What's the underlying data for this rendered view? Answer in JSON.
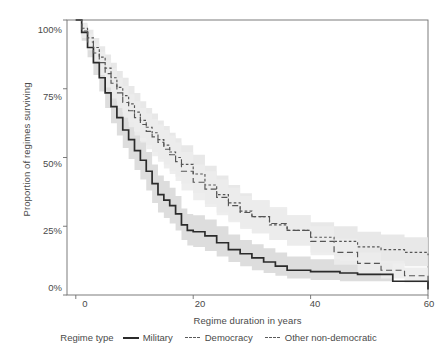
{
  "chart_data": {
    "type": "line",
    "title": "",
    "subtitle": "",
    "xlabel": "Regime duration in years",
    "ylabel": "Proportion of regimes surviving",
    "xlim": [
      -1.5,
      60
    ],
    "ylim": [
      0,
      1
    ],
    "xticks": [
      0,
      20,
      40,
      60
    ],
    "xticklabels": [
      "0",
      "20",
      "40",
      "60"
    ],
    "yticks": [
      0,
      0.25,
      0.5,
      0.75,
      1
    ],
    "yticklabels": [
      "0%",
      "25%",
      "50%",
      "75%",
      "100%"
    ],
    "grid": false,
    "legend_position": "bottom",
    "legend_title": "Regime type",
    "series": [
      {
        "name": "Military",
        "style": "solid",
        "color": "#2b2b2b",
        "band_color": "#d9d9d9",
        "x": [
          0,
          1,
          2,
          3,
          4,
          5,
          6,
          7,
          8,
          9,
          10,
          11,
          12,
          13,
          14,
          15,
          16,
          17,
          18,
          19,
          20,
          22,
          24,
          26,
          28,
          30,
          32,
          34,
          36,
          40,
          45,
          48,
          54,
          60
        ],
        "y": [
          1.0,
          0.955,
          0.9,
          0.845,
          0.79,
          0.735,
          0.685,
          0.645,
          0.6,
          0.565,
          0.525,
          0.49,
          0.45,
          0.405,
          0.365,
          0.345,
          0.325,
          0.295,
          0.255,
          0.235,
          0.23,
          0.215,
          0.19,
          0.165,
          0.15,
          0.135,
          0.12,
          0.105,
          0.09,
          0.085,
          0.08,
          0.075,
          0.05,
          0.02
        ],
        "lower": [
          1.0,
          0.925,
          0.865,
          0.8,
          0.74,
          0.68,
          0.625,
          0.58,
          0.535,
          0.495,
          0.455,
          0.42,
          0.38,
          0.335,
          0.3,
          0.28,
          0.26,
          0.235,
          0.2,
          0.18,
          0.175,
          0.16,
          0.14,
          0.12,
          0.105,
          0.09,
          0.08,
          0.07,
          0.06,
          0.055,
          0.05,
          0.05,
          0.05,
          0.02
        ],
        "upper": [
          1.0,
          0.98,
          0.94,
          0.895,
          0.845,
          0.79,
          0.745,
          0.705,
          0.665,
          0.63,
          0.595,
          0.56,
          0.52,
          0.475,
          0.435,
          0.415,
          0.39,
          0.36,
          0.315,
          0.295,
          0.29,
          0.275,
          0.25,
          0.22,
          0.2,
          0.185,
          0.17,
          0.155,
          0.14,
          0.13,
          0.125,
          0.12,
          0.05,
          0.02
        ]
      },
      {
        "name": "Democracy",
        "style": "dotted",
        "color": "#555555",
        "band_color": "#e6e6e6",
        "x": [
          0,
          1,
          2,
          3,
          4,
          5,
          6,
          7,
          8,
          9,
          10,
          11,
          12,
          13,
          14,
          15,
          16,
          17,
          18,
          20,
          22,
          24,
          26,
          28,
          30,
          33,
          36,
          40,
          44,
          48,
          52,
          56,
          60
        ],
        "y": [
          1.0,
          0.97,
          0.935,
          0.9,
          0.865,
          0.825,
          0.79,
          0.755,
          0.725,
          0.695,
          0.665,
          0.635,
          0.61,
          0.59,
          0.565,
          0.545,
          0.52,
          0.5,
          0.475,
          0.44,
          0.4,
          0.365,
          0.335,
          0.305,
          0.285,
          0.255,
          0.235,
          0.21,
          0.195,
          0.175,
          0.165,
          0.155,
          0.145
        ],
        "lower": [
          1.0,
          0.945,
          0.905,
          0.865,
          0.82,
          0.775,
          0.735,
          0.7,
          0.665,
          0.63,
          0.6,
          0.57,
          0.545,
          0.52,
          0.495,
          0.475,
          0.45,
          0.43,
          0.405,
          0.37,
          0.33,
          0.3,
          0.27,
          0.245,
          0.225,
          0.2,
          0.18,
          0.155,
          0.14,
          0.125,
          0.115,
          0.105,
          0.095
        ],
        "upper": [
          1.0,
          0.99,
          0.965,
          0.935,
          0.905,
          0.875,
          0.845,
          0.815,
          0.79,
          0.76,
          0.735,
          0.705,
          0.68,
          0.66,
          0.635,
          0.615,
          0.59,
          0.57,
          0.545,
          0.51,
          0.47,
          0.435,
          0.4,
          0.37,
          0.345,
          0.315,
          0.29,
          0.265,
          0.25,
          0.23,
          0.22,
          0.21,
          0.2
        ]
      },
      {
        "name": "Other non-democratic",
        "style": "dashed",
        "color": "#555555",
        "band_color": "#ececec",
        "x": [
          0,
          1,
          2,
          3,
          4,
          5,
          6,
          7,
          8,
          9,
          10,
          11,
          12,
          13,
          14,
          15,
          16,
          17,
          18,
          20,
          22,
          24,
          26,
          28,
          30,
          33,
          36,
          40,
          44,
          48,
          52,
          56,
          60
        ],
        "y": [
          1.0,
          0.96,
          0.92,
          0.88,
          0.845,
          0.805,
          0.77,
          0.735,
          0.7,
          0.67,
          0.645,
          0.62,
          0.595,
          0.575,
          0.555,
          0.53,
          0.51,
          0.485,
          0.45,
          0.41,
          0.385,
          0.355,
          0.325,
          0.3,
          0.285,
          0.26,
          0.235,
          0.195,
          0.155,
          0.115,
          0.09,
          0.07,
          0.045
        ],
        "lower": [
          1.0,
          0.935,
          0.89,
          0.845,
          0.8,
          0.755,
          0.715,
          0.68,
          0.645,
          0.61,
          0.58,
          0.555,
          0.53,
          0.505,
          0.485,
          0.46,
          0.44,
          0.415,
          0.38,
          0.345,
          0.32,
          0.29,
          0.265,
          0.24,
          0.225,
          0.2,
          0.18,
          0.145,
          0.11,
          0.08,
          0.06,
          0.045,
          0.025
        ],
        "upper": [
          1.0,
          0.985,
          0.95,
          0.915,
          0.885,
          0.855,
          0.825,
          0.79,
          0.76,
          0.73,
          0.705,
          0.68,
          0.66,
          0.64,
          0.62,
          0.6,
          0.58,
          0.555,
          0.52,
          0.475,
          0.45,
          0.42,
          0.39,
          0.36,
          0.345,
          0.32,
          0.29,
          0.25,
          0.205,
          0.155,
          0.125,
          0.1,
          0.07
        ]
      }
    ]
  },
  "axes": {
    "xlabel": "Regime duration in years",
    "ylabel": "Proportion of regimes surviving",
    "xticklabels": [
      "0",
      "20",
      "40",
      "60"
    ],
    "yticklabels": [
      "100%",
      "75%",
      "50%",
      "25%",
      "0%"
    ]
  },
  "legend": {
    "title": "Regime type",
    "entries": [
      {
        "label": "Military"
      },
      {
        "label": "Democracy"
      },
      {
        "label": "Other non-democratic"
      }
    ]
  },
  "colors": {
    "military": "#2b2b2b",
    "democracy": "#555555",
    "other": "#555555",
    "band": "#dcdcdc",
    "axis": "#6e6e6e",
    "text": "#4a4a4a"
  }
}
